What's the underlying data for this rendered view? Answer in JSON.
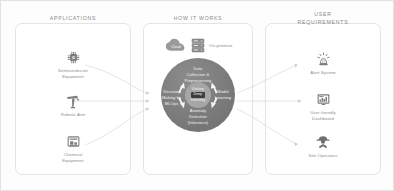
{
  "diagram": {
    "accent_color": "#7b7b7b",
    "hub_color": "#a6a6a6",
    "connector_color": "#cfcfcf",
    "panel_border_color": "#e4e4e4",
    "text_color": "#8c8c8c"
  },
  "columns": {
    "applications": {
      "header": "APPLICATIONS",
      "items": [
        {
          "label_line1": "Semiconductor",
          "label_line2": "Equipment",
          "icon": "microchip-icon"
        },
        {
          "label_line1": "Robotic Arm",
          "label_line2": "",
          "icon": "robotic-arm-icon"
        },
        {
          "label_line1": "Chemical",
          "label_line2": "Equipment",
          "icon": "chemical-equipment-icon"
        }
      ]
    },
    "how_it_works": {
      "header": "HOW IT WORKS",
      "infrastructure": [
        {
          "label": "Cloud",
          "icon": "cloud-icon"
        },
        {
          "label": "On-premise",
          "icon": "server-rack-icon"
        }
      ],
      "cycle": {
        "hub": {
          "line1": "Unitary",
          "line2": "Deep",
          "line3": "Learning"
        },
        "segments": [
          {
            "id": "top",
            "line1": "Data",
            "line2": "Collection &",
            "line3": "Preprocessing"
          },
          {
            "id": "right",
            "line1": "Model",
            "line2": "Learning",
            "line3": ""
          },
          {
            "id": "bottom",
            "line1": "Anomaly",
            "line2": "Detection",
            "line3": "(Inference)"
          },
          {
            "id": "left",
            "line1": "Decision",
            "line2": "Making by",
            "line3": "MLOps"
          }
        ]
      }
    },
    "user_requirements": {
      "header_line1": "USER",
      "header_line2": "REQUIREMENTS",
      "items": [
        {
          "label_line1": "Alert System",
          "label_line2": "",
          "icon": "alert-beacon-icon"
        },
        {
          "label_line1": "User-friendly",
          "label_line2": "Dashboard",
          "icon": "dashboard-icon"
        },
        {
          "label_line1": "Site Operators",
          "label_line2": "",
          "icon": "operator-icon"
        }
      ]
    }
  }
}
